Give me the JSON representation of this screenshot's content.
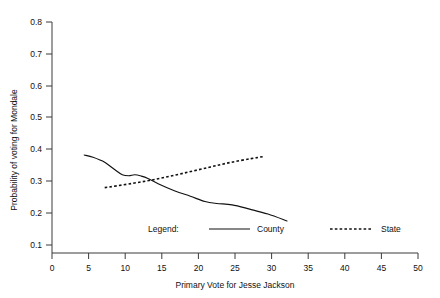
{
  "chart_data": {
    "type": "line",
    "title": "",
    "xlabel": "Primary Vote for Jesse Jackson",
    "ylabel": "Probability of voting for Mondale",
    "xlim": [
      0,
      50
    ],
    "ylim": [
      0.1,
      0.8
    ],
    "xticks": [
      "0",
      "5",
      "10",
      "15",
      "20",
      "25",
      "30",
      "35",
      "40",
      "45",
      "50"
    ],
    "xtick_values": [
      0,
      5,
      10,
      15,
      20,
      25,
      30,
      35,
      40,
      45,
      50
    ],
    "yticks": [
      "0.1",
      "0.2",
      "0.3",
      "0.4",
      "0.5",
      "0.6",
      "0.7",
      "0.8"
    ],
    "ytick_values": [
      0.1,
      0.2,
      0.3,
      0.4,
      0.5,
      0.6,
      0.7,
      0.8
    ],
    "grid": false,
    "legend_position": "inside-bottom-center",
    "legend_title": "Legend:",
    "series": [
      {
        "name": "County",
        "style": "solid",
        "color": "#111111",
        "x": [
          4.4,
          5.6,
          7.2,
          8.6,
          9.6,
          10.5,
          11.3,
          12.2,
          13.1,
          14.5,
          16.8,
          18.9,
          20.9,
          22.5,
          24.6,
          27.0,
          29.5,
          32.1
        ],
        "y": [
          0.397,
          0.39,
          0.375,
          0.352,
          0.337,
          0.334,
          0.337,
          0.333,
          0.326,
          0.31,
          0.288,
          0.272,
          0.256,
          0.25,
          0.246,
          0.233,
          0.218,
          0.197
        ]
      },
      {
        "name": "State",
        "style": "dotted",
        "color": "#111111",
        "x": [
          7.2,
          11.0,
          14.5,
          18.0,
          21.5,
          24.5,
          27.2,
          28.8
        ],
        "y": [
          0.298,
          0.311,
          0.325,
          0.342,
          0.36,
          0.375,
          0.386,
          0.392
        ]
      }
    ]
  },
  "legend": {
    "title": "Legend:",
    "entries": [
      {
        "label": "County",
        "style": "solid"
      },
      {
        "label": "State",
        "style": "dotted"
      }
    ]
  },
  "axes": {
    "x_title": "Primary Vote for Jesse Jackson",
    "y_title": "Probability of voting for Mondale"
  }
}
